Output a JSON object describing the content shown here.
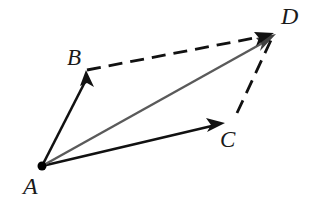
{
  "figure": {
    "background_color": "#ffffff",
    "width": 320,
    "height": 201,
    "points": [
      {
        "id": "A",
        "label": "A",
        "x": 42,
        "y": 166,
        "has_dot": true,
        "label_x": 23,
        "label_y": 174
      },
      {
        "id": "B",
        "label": "B",
        "x": 86,
        "y": 71,
        "has_dot": false,
        "label_x": 67,
        "label_y": 46
      },
      {
        "id": "C",
        "label": "C",
        "x": 223,
        "y": 124,
        "has_dot": false,
        "label_x": 220,
        "label_y": 128
      },
      {
        "id": "D",
        "label": "D",
        "x": 274,
        "y": 34,
        "has_dot": false,
        "label_x": 281,
        "label_y": 4
      }
    ],
    "vectors": [
      {
        "id": "AB",
        "from": "A",
        "to": "B",
        "style": "solid",
        "color": "#111111",
        "width": 2.6,
        "arrowhead": true
      },
      {
        "id": "AC",
        "from": "A",
        "to": "C",
        "style": "solid",
        "color": "#111111",
        "width": 2.6,
        "arrowhead": true
      },
      {
        "id": "AD",
        "from": "A",
        "to": "D",
        "style": "solid",
        "color": "#5a5a5a",
        "width": 2.4,
        "arrowhead": true
      },
      {
        "id": "BD",
        "from": "B",
        "to": "D",
        "style": "dashed",
        "color": "#111111",
        "width": 2.8,
        "arrowhead": true
      },
      {
        "id": "CD",
        "from": "C",
        "to": "D",
        "style": "dashed",
        "color": "#111111",
        "width": 2.8,
        "arrowhead": false
      }
    ],
    "dash_pattern": "14 8",
    "dot_color": "#000000",
    "dot_radius": 4.5
  }
}
